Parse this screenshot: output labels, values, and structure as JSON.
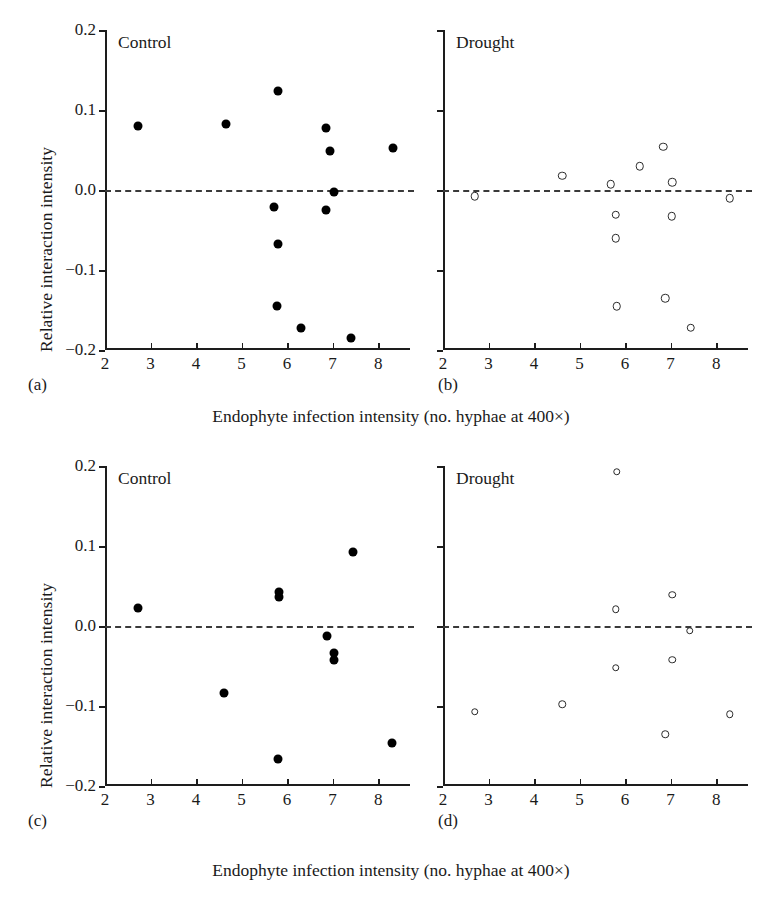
{
  "figure": {
    "axis_titles": {
      "y": "Relative interaction intensity",
      "x": "Endophyte infection intensity (no. hyphae at 400×)"
    },
    "x_ticks": [
      "2",
      "3",
      "4",
      "5",
      "6",
      "7",
      "8"
    ],
    "y_ticks": [
      "0.2",
      "0.1",
      "0.0",
      "−0.1",
      "−0.2"
    ],
    "panel_labels": [
      "(a)",
      "(b)",
      "(c)",
      "(d)"
    ],
    "panel_titles": [
      "Control",
      "Drought",
      "Control",
      "Drought"
    ]
  },
  "chart_data": [
    {
      "type": "scatter",
      "panel": "(a)",
      "title": "Control",
      "marker": "filled-circle",
      "xlabel": "Endophyte infection intensity (no. hyphae at 400×)",
      "ylabel": "Relative interaction intensity",
      "xlim": [
        2,
        8.7
      ],
      "ylim": [
        -0.2,
        0.2
      ],
      "xticks": [
        2,
        3,
        4,
        5,
        6,
        7,
        8
      ],
      "yticks": [
        0.2,
        0.1,
        0.0,
        -0.1,
        -0.2
      ],
      "grid": false,
      "reference_line": 0.0,
      "reference_line_style": "dashed",
      "points": [
        {
          "x": 2.72,
          "y": 0.08
        },
        {
          "x": 4.66,
          "y": 0.082
        },
        {
          "x": 5.8,
          "y": 0.124
        },
        {
          "x": 6.86,
          "y": 0.078
        },
        {
          "x": 6.95,
          "y": 0.049
        },
        {
          "x": 8.32,
          "y": 0.053
        },
        {
          "x": 7.03,
          "y": -0.002
        },
        {
          "x": 5.72,
          "y": -0.021
        },
        {
          "x": 6.86,
          "y": -0.025
        },
        {
          "x": 5.8,
          "y": -0.068
        },
        {
          "x": 5.78,
          "y": -0.145
        },
        {
          "x": 6.3,
          "y": -0.172
        },
        {
          "x": 7.4,
          "y": -0.185
        }
      ]
    },
    {
      "type": "scatter",
      "panel": "(b)",
      "title": "Drought",
      "marker": "open-circle",
      "xlabel": "Endophyte infection intensity (no. hyphae at 400×)",
      "ylabel": "Relative interaction intensity",
      "xlim": [
        2,
        8.7
      ],
      "ylim": [
        -0.2,
        0.2
      ],
      "xticks": [
        2,
        3,
        4,
        5,
        6,
        7,
        8
      ],
      "yticks": [
        0.2,
        0.1,
        0.0,
        -0.1,
        -0.2
      ],
      "grid": false,
      "reference_line": 0.0,
      "reference_line_style": "dashed",
      "points": [
        {
          "x": 2.7,
          "y": -0.008
        },
        {
          "x": 4.62,
          "y": 0.018
        },
        {
          "x": 5.68,
          "y": 0.007
        },
        {
          "x": 6.32,
          "y": 0.03
        },
        {
          "x": 6.84,
          "y": 0.054
        },
        {
          "x": 7.04,
          "y": 0.01
        },
        {
          "x": 8.3,
          "y": -0.01
        },
        {
          "x": 5.8,
          "y": -0.031
        },
        {
          "x": 7.02,
          "y": -0.033
        },
        {
          "x": 5.8,
          "y": -0.06
        },
        {
          "x": 5.82,
          "y": -0.145
        },
        {
          "x": 6.88,
          "y": -0.135
        },
        {
          "x": 7.44,
          "y": -0.172
        }
      ]
    },
    {
      "type": "scatter",
      "panel": "(c)",
      "title": "Control",
      "marker": "filled-circle",
      "xlabel": "Endophyte infection intensity (no. hyphae at 400×)",
      "ylabel": "Relative interaction intensity",
      "xlim": [
        2,
        8.7
      ],
      "ylim": [
        -0.2,
        0.2
      ],
      "xticks": [
        2,
        3,
        4,
        5,
        6,
        7,
        8
      ],
      "yticks": [
        0.2,
        0.1,
        0.0,
        -0.1,
        -0.2
      ],
      "grid": false,
      "reference_line": 0.0,
      "reference_line_style": "dashed",
      "points": [
        {
          "x": 7.44,
          "y": 0.092
        },
        {
          "x": 5.82,
          "y": 0.042
        },
        {
          "x": 5.82,
          "y": 0.036
        },
        {
          "x": 2.72,
          "y": 0.022
        },
        {
          "x": 6.88,
          "y": -0.012
        },
        {
          "x": 7.02,
          "y": -0.034
        },
        {
          "x": 7.02,
          "y": -0.042
        },
        {
          "x": 4.62,
          "y": -0.084
        },
        {
          "x": 8.3,
          "y": -0.146
        },
        {
          "x": 5.8,
          "y": -0.166
        }
      ]
    },
    {
      "type": "scatter",
      "panel": "(d)",
      "title": "Drought",
      "marker": "open-circle",
      "xlabel": "Endophyte infection intensity (no. hyphae at 400×)",
      "ylabel": "Relative interaction intensity",
      "xlim": [
        2,
        8.7
      ],
      "ylim": [
        -0.2,
        0.2
      ],
      "xticks": [
        2,
        3,
        4,
        5,
        6,
        7,
        8
      ],
      "yticks": [
        0.2,
        0.1,
        0.0,
        -0.1,
        -0.2
      ],
      "grid": false,
      "reference_line": 0.0,
      "reference_line_style": "dashed",
      "points": [
        {
          "x": 5.82,
          "y": 0.193
        },
        {
          "x": 7.04,
          "y": 0.039
        },
        {
          "x": 5.8,
          "y": 0.021
        },
        {
          "x": 7.42,
          "y": -0.006
        },
        {
          "x": 7.04,
          "y": -0.042
        },
        {
          "x": 5.8,
          "y": -0.052
        },
        {
          "x": 2.7,
          "y": -0.107
        },
        {
          "x": 4.62,
          "y": -0.098
        },
        {
          "x": 8.3,
          "y": -0.11
        },
        {
          "x": 6.88,
          "y": -0.135
        }
      ]
    }
  ]
}
